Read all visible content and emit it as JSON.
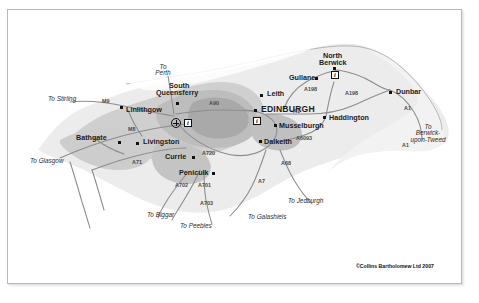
{
  "map": {
    "title": "Edinburgh and the Lothians regional road map",
    "credit": "©Collins Bartholomew Ltd 2007",
    "colors": {
      "paper": "#ffffff",
      "land": "#e9e9e9",
      "urban": "#c9c9c9",
      "urban_core": "#a8a8a8",
      "sea": "#f7f7f7",
      "road": "#8a8a8a",
      "motorway": "#9a9a9a",
      "border": "#b8b8b8",
      "text": "#1b1b1b"
    },
    "places": [
      {
        "name": "EDINBURGH",
        "kind": "city",
        "x": 253,
        "y": 99
      },
      {
        "name": "Leith",
        "kind": "town",
        "x": 259,
        "y": 83
      },
      {
        "name": "South",
        "kind": "town",
        "x": 178,
        "y": 78
      },
      {
        "name": "Queensferry",
        "kind": "town",
        "x": 172,
        "y": 85
      },
      {
        "name": "Linlithgow",
        "kind": "town",
        "x": 118,
        "y": 99
      },
      {
        "name": "Bathgate",
        "kind": "town",
        "x": 80,
        "y": 123
      },
      {
        "name": "Livingston",
        "kind": "town",
        "x": 135,
        "y": 130
      },
      {
        "name": "Currie",
        "kind": "town",
        "x": 160,
        "y": 144
      },
      {
        "name": "Penicuik",
        "kind": "town",
        "x": 186,
        "y": 161
      },
      {
        "name": "Musselburgh",
        "kind": "town",
        "x": 272,
        "y": 112
      },
      {
        "name": "Dalkeith",
        "kind": "town",
        "x": 257,
        "y": 128
      },
      {
        "name": "Haddington",
        "kind": "town",
        "x": 322,
        "y": 105
      },
      {
        "name": "Gullane",
        "kind": "town",
        "x": 288,
        "y": 64
      },
      {
        "name": "North",
        "kind": "town",
        "x": 327,
        "y": 46
      },
      {
        "name": "Berwick",
        "kind": "town",
        "x": 325,
        "y": 54
      },
      {
        "name": "Dunbar",
        "kind": "town",
        "x": 390,
        "y": 79
      }
    ],
    "road_labels": [
      {
        "label": "M9",
        "x": 98,
        "y": 92
      },
      {
        "label": "M8",
        "x": 124,
        "y": 120
      },
      {
        "label": "A71",
        "x": 128,
        "y": 151
      },
      {
        "label": "A90",
        "x": 205,
        "y": 94
      },
      {
        "label": "A720",
        "x": 198,
        "y": 143
      },
      {
        "label": "A1",
        "x": 288,
        "y": 101
      },
      {
        "label": "A6093",
        "x": 293,
        "y": 127
      },
      {
        "label": "A198",
        "x": 301,
        "y": 79
      },
      {
        "label": "A198",
        "x": 341,
        "y": 83
      },
      {
        "label": "A1",
        "x": 398,
        "y": 98
      },
      {
        "label": "A1",
        "x": 398,
        "y": 135
      },
      {
        "label": "A702",
        "x": 172,
        "y": 175
      },
      {
        "label": "A701",
        "x": 195,
        "y": 175
      },
      {
        "label": "A703",
        "x": 196,
        "y": 193
      },
      {
        "label": "A7",
        "x": 253,
        "y": 171
      },
      {
        "label": "A68",
        "x": 277,
        "y": 153
      }
    ],
    "directions": [
      {
        "label": "To\nPerth",
        "x": 150,
        "y": 59
      },
      {
        "label": "To Stirling",
        "x": 65,
        "y": 88
      },
      {
        "label": "To Glasgow",
        "x": 48,
        "y": 150
      },
      {
        "label": "To Biggar",
        "x": 164,
        "y": 204
      },
      {
        "label": "To Peebles",
        "x": 199,
        "y": 215
      },
      {
        "label": "To Galashiels",
        "x": 270,
        "y": 206
      },
      {
        "label": "To Jedburgh",
        "x": 305,
        "y": 190
      },
      {
        "label": "To\nBerwick-\nupon-Tweed",
        "x": 418,
        "y": 122
      }
    ],
    "icons": [
      {
        "name": "airport-icon",
        "x": 167,
        "y": 110
      },
      {
        "name": "information-icon",
        "x": 180,
        "y": 111,
        "glyph": "i"
      },
      {
        "name": "information-icon",
        "x": 249,
        "y": 107,
        "glyph": "i"
      },
      {
        "name": "information-icon",
        "x": 327,
        "y": 62,
        "glyph": "i"
      }
    ]
  }
}
